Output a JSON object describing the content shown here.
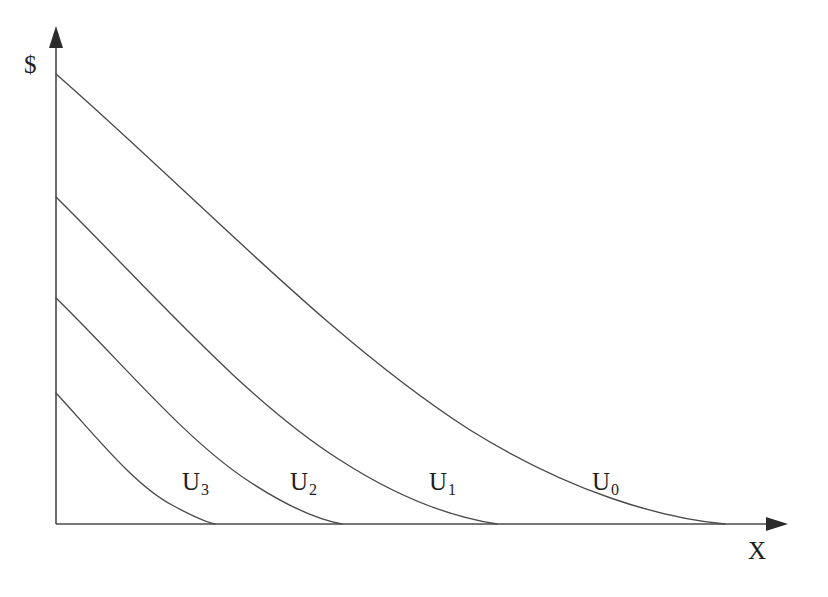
{
  "chart_data": {
    "type": "line",
    "title": "",
    "subtitle": "",
    "xlabel": "X",
    "ylabel": "$",
    "xlim": [
      0,
      780
    ],
    "ylim": [
      0,
      500
    ],
    "grid": false,
    "legend_position": "inline-on-curves",
    "axes": {
      "x_axis_name": "X",
      "y_axis_name": "$",
      "x_arrow": true,
      "y_arrow": true,
      "ticks": [],
      "tick_labels": []
    },
    "annotations": [
      {
        "text": "U3",
        "label": "U",
        "subscript": "3",
        "x": 195,
        "y": 481
      },
      {
        "text": "U2",
        "label": "U",
        "subscript": "2",
        "x": 303,
        "y": 481
      },
      {
        "text": "U1",
        "label": "U",
        "subscript": "1",
        "x": 442,
        "y": 481
      },
      {
        "text": "U0",
        "label": "U",
        "subscript": "0",
        "x": 605,
        "y": 481
      }
    ],
    "series": [
      {
        "name": "U0",
        "label": "U",
        "subscript": "0",
        "description": "highest indifference curve",
        "y_intercept_px": 74,
        "x_intercept_px": 725,
        "path": "M 56 74 C 200 200, 330 340, 470 430 C 570 492, 660 518, 725 524"
      },
      {
        "name": "U1",
        "label": "U",
        "subscript": "1",
        "description": "second indifference curve",
        "y_intercept_px": 197,
        "x_intercept_px": 497,
        "path": "M 56 197 C 150 290, 245 400, 340 460 C 405 502, 458 518, 497 524"
      },
      {
        "name": "U2",
        "label": "U",
        "subscript": "2",
        "description": "third indifference curve",
        "y_intercept_px": 298,
        "x_intercept_px": 342,
        "path": "M 56 298 C 120 360, 185 440, 250 482 C 290 508, 320 520, 342 524"
      },
      {
        "name": "U3",
        "label": "U",
        "subscript": "3",
        "description": "lowest indifference curve",
        "y_intercept_px": 393,
        "x_intercept_px": 215,
        "path": "M 56 393 C 95 435, 134 485, 172 505 C 194 517, 206 522, 215 524"
      }
    ],
    "colors": {
      "curve": "#4a4a4a",
      "axis": "#4a4a4a",
      "text": "#1d1d1d",
      "background": "#ffffff"
    }
  },
  "figure": {
    "y_axis_label": "$",
    "x_axis_label": "X"
  }
}
